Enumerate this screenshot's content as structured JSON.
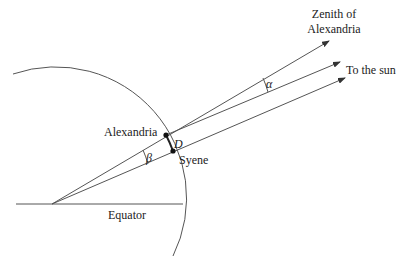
{
  "diagram": {
    "type": "geometric-figure",
    "labels": {
      "zenith_line1": "Zenith of",
      "zenith_line2": "Alexandria",
      "sun": "To the sun",
      "alexandria": "Alexandria",
      "syene": "Syene",
      "distance": "D",
      "equator": "Equator",
      "alpha": "α",
      "beta": "β"
    },
    "points": {
      "earth_center": [
        52,
        204
      ],
      "alexandria": [
        166,
        135
      ],
      "syene": [
        173,
        151
      ]
    },
    "arrows": [
      {
        "name": "zenith-of-alexandria",
        "from": [
          52,
          204
        ],
        "to": [
          329,
          41
        ]
      },
      {
        "name": "sun-ray-alexandria",
        "from": [
          166,
          135
        ],
        "to": [
          340,
          62
        ]
      },
      {
        "name": "sun-ray-syene",
        "from": [
          52,
          204
        ],
        "to": [
          345,
          78
        ]
      }
    ],
    "colors": {
      "line": "#555555",
      "text": "#222222",
      "background": "#ffffff"
    }
  }
}
